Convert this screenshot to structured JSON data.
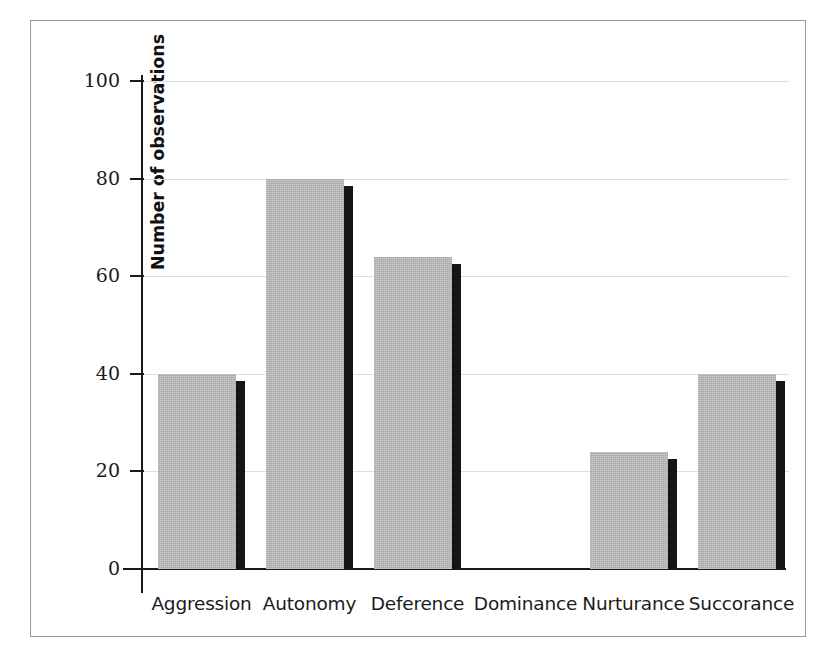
{
  "chart_data": {
    "type": "bar",
    "title": "",
    "subtitle": "",
    "xlabel": "",
    "ylabel": "Number of observations",
    "categories": [
      "Aggression",
      "Autonomy",
      "Deference",
      "Dominance",
      "Nurturance",
      "Succorance"
    ],
    "values": [
      40,
      80,
      64,
      0,
      24,
      40
    ],
    "series": [
      {
        "name": "Number of observations",
        "values": [
          40,
          80,
          64,
          0,
          24,
          40
        ]
      }
    ],
    "ylim": [
      0,
      100
    ],
    "y_ticks": [
      0,
      20,
      40,
      60,
      80,
      100
    ],
    "y_tick_labels": [
      "0",
      "20",
      "40",
      "60",
      "80",
      "100"
    ],
    "grid": "horizontal",
    "legend_position": "none",
    "annotations": [],
    "bar_color": "#b8b8b8",
    "bar_shadow_color": "#151515",
    "gridline_color": "#dcdcdc",
    "axis_color": "#1a1a1a",
    "frame_color": "#9a9a9a",
    "background_color": "#ffffff"
  }
}
